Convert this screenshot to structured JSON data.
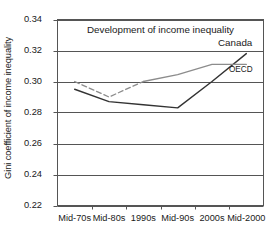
{
  "chart_data": {
    "type": "line",
    "title": "Development of income inequality",
    "xlabel": "",
    "ylabel": "Gini coefficient of income inequality",
    "categories": [
      "Mid-70s",
      "Mid-80s",
      "1990s",
      "Mid-90s",
      "2000s",
      "Mid-2000"
    ],
    "ylim": [
      0.22,
      0.34
    ],
    "ytick_step": 0.02,
    "yticks": [
      "0.34",
      "0.32",
      "0.30",
      "0.28",
      "0.26",
      "0.24",
      "0.22"
    ],
    "ytick_values": [
      0.34,
      0.32,
      0.3,
      0.28,
      0.26,
      0.24,
      0.22
    ],
    "grid": "horizontal",
    "legend_position": "inline-right",
    "series": [
      {
        "name": "Canada",
        "color": "#333333",
        "style": "solid",
        "values": [
          0.295,
          0.287,
          0.285,
          0.283,
          0.3,
          0.318
        ]
      },
      {
        "name": "OECD",
        "color": "#8c8c8c",
        "style": "dashed-then-solid",
        "dashed_until_index": 2,
        "values": [
          0.3,
          0.29,
          0.3,
          0.3045,
          0.311,
          0.311
        ]
      }
    ],
    "annotations": [
      {
        "text": "Canada",
        "series": "Canada"
      },
      {
        "text": "OECD",
        "series": "OECD"
      }
    ]
  }
}
